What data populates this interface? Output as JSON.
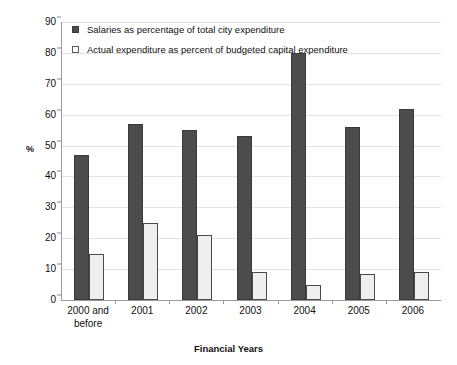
{
  "chart_data": {
    "type": "bar",
    "title": "",
    "xlabel": "Financial Years",
    "ylabel": "%",
    "ylim": [
      0,
      90
    ],
    "yticks": [
      0,
      10,
      20,
      30,
      40,
      50,
      60,
      70,
      80,
      90
    ],
    "grid": true,
    "legend_position": "top-left",
    "categories": [
      "2000 and before",
      "2001",
      "2002",
      "2003",
      "2004",
      "2005",
      "2006"
    ],
    "series": [
      {
        "name": "Salaries as percentage of total city expenditure",
        "color": "#4c4c4c",
        "values": [
          47,
          57,
          55,
          53,
          80,
          56,
          62
        ]
      },
      {
        "name": "Actual expenditure as percent of budgeted capital expenditure",
        "color": "#efefef",
        "values": [
          15,
          25,
          21,
          9,
          5,
          8.5,
          9
        ]
      }
    ]
  },
  "axis": {
    "y_title": "%",
    "x_title": "Financial Years",
    "y_tick_labels": [
      "90",
      "80",
      "70",
      "60",
      "50",
      "40",
      "30",
      "20",
      "10",
      "0"
    ],
    "x_tick_labels": [
      [
        "2000 and",
        "before"
      ],
      [
        "2001"
      ],
      [
        "2002"
      ],
      [
        "2003"
      ],
      [
        "2004"
      ],
      [
        "2005"
      ],
      [
        "2006"
      ]
    ]
  },
  "legend": {
    "items": [
      {
        "label": "Salaries as percentage of total city expenditure",
        "swatch": "filled-dark-square"
      },
      {
        "label": "Actual expenditure as percent of budgeted capital expenditure",
        "swatch": "open-white-square"
      }
    ]
  },
  "colors": {
    "series_dark": "#4c4c4c",
    "series_light": "#efefef",
    "gridline": "#e3e3e3",
    "axis": "#9a9a9a",
    "text": "#111111",
    "background": "#ffffff"
  }
}
